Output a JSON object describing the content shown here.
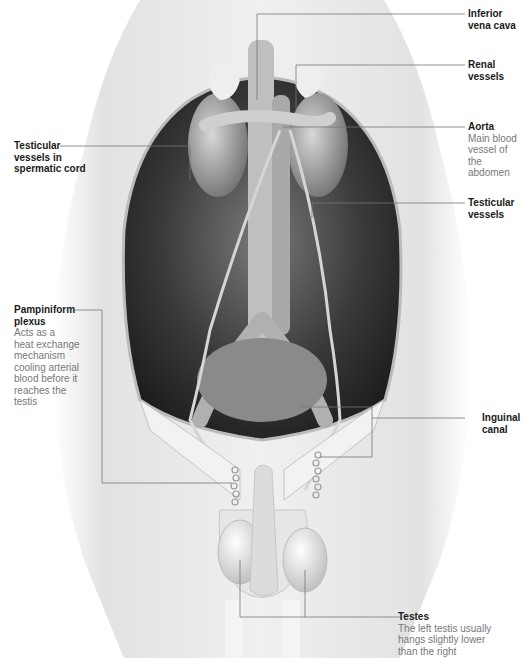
{
  "figure": {
    "colors": {
      "body": "#e8e8e8",
      "cavity": "#2a2a2a",
      "leader": "#777777",
      "title_text": "#1a1a1a",
      "desc_text": "#777777"
    }
  },
  "labels": {
    "ivc": {
      "title": "Inferior\nvena cava",
      "desc": ""
    },
    "renal": {
      "title": "Renal\nvessels",
      "desc": ""
    },
    "aorta": {
      "title": "Aorta",
      "desc": "Main blood\nvessel of the\nabdomen"
    },
    "testicular_right": {
      "title": "Testicular\nvessels",
      "desc": ""
    },
    "testicular_cord": {
      "title": "Testicular\nvessels in\nspermatic cord",
      "desc": ""
    },
    "pampiniform": {
      "title": "Pampiniform\nplexus",
      "desc": "Acts as a\nheat exchange\nmechanism\ncooling arterial\nblood before it\nreaches the\ntestis"
    },
    "inguinal": {
      "title": "Inguinal\ncanal",
      "desc": ""
    },
    "testes": {
      "title": "Testes",
      "desc": "The left testis usually\nhangs slightly lower\nthan the right"
    }
  }
}
